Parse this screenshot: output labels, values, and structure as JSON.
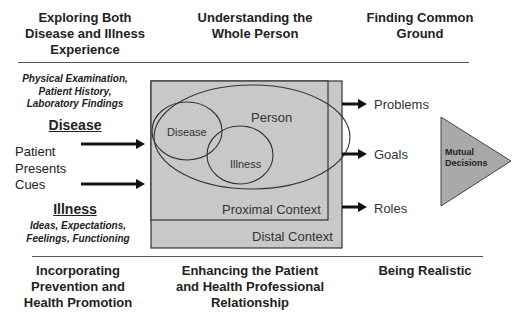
{
  "header": {
    "col1": [
      "Exploring Both",
      "Disease and Illness",
      "Experience"
    ],
    "col2": [
      "Understanding the",
      "Whole Person"
    ],
    "col3": [
      "Finding Common",
      "Ground"
    ]
  },
  "left": {
    "disease_sources": [
      "Physical Examination,",
      "Patient History,",
      "Laboratory Findings"
    ],
    "disease_label": "Disease",
    "cues": [
      "Patient",
      "Presents",
      "Cues"
    ],
    "illness_label": "Illness",
    "illness_sources": [
      "Ideas, Expectations,",
      "Feelings, Functioning"
    ]
  },
  "center": {
    "person": "Person",
    "disease": "Disease",
    "illness": "Illness",
    "proximal": "Proximal Context",
    "distal": "Distal Context"
  },
  "right": {
    "outputs": [
      "Problems",
      "Goals",
      "Roles"
    ],
    "triangle": [
      "Mutual",
      "Decisions"
    ]
  },
  "footer": {
    "col1": [
      "Incorporating",
      "Prevention and",
      "Health Promotion"
    ],
    "col2": [
      "Enhancing the Patient",
      "and Health Professional",
      "Relationship"
    ],
    "col3": [
      "Being Realistic"
    ]
  },
  "colors": {
    "box_fill": "#c8c8c8",
    "triangle_fill": "#a9a9a9",
    "line": "#333333"
  }
}
